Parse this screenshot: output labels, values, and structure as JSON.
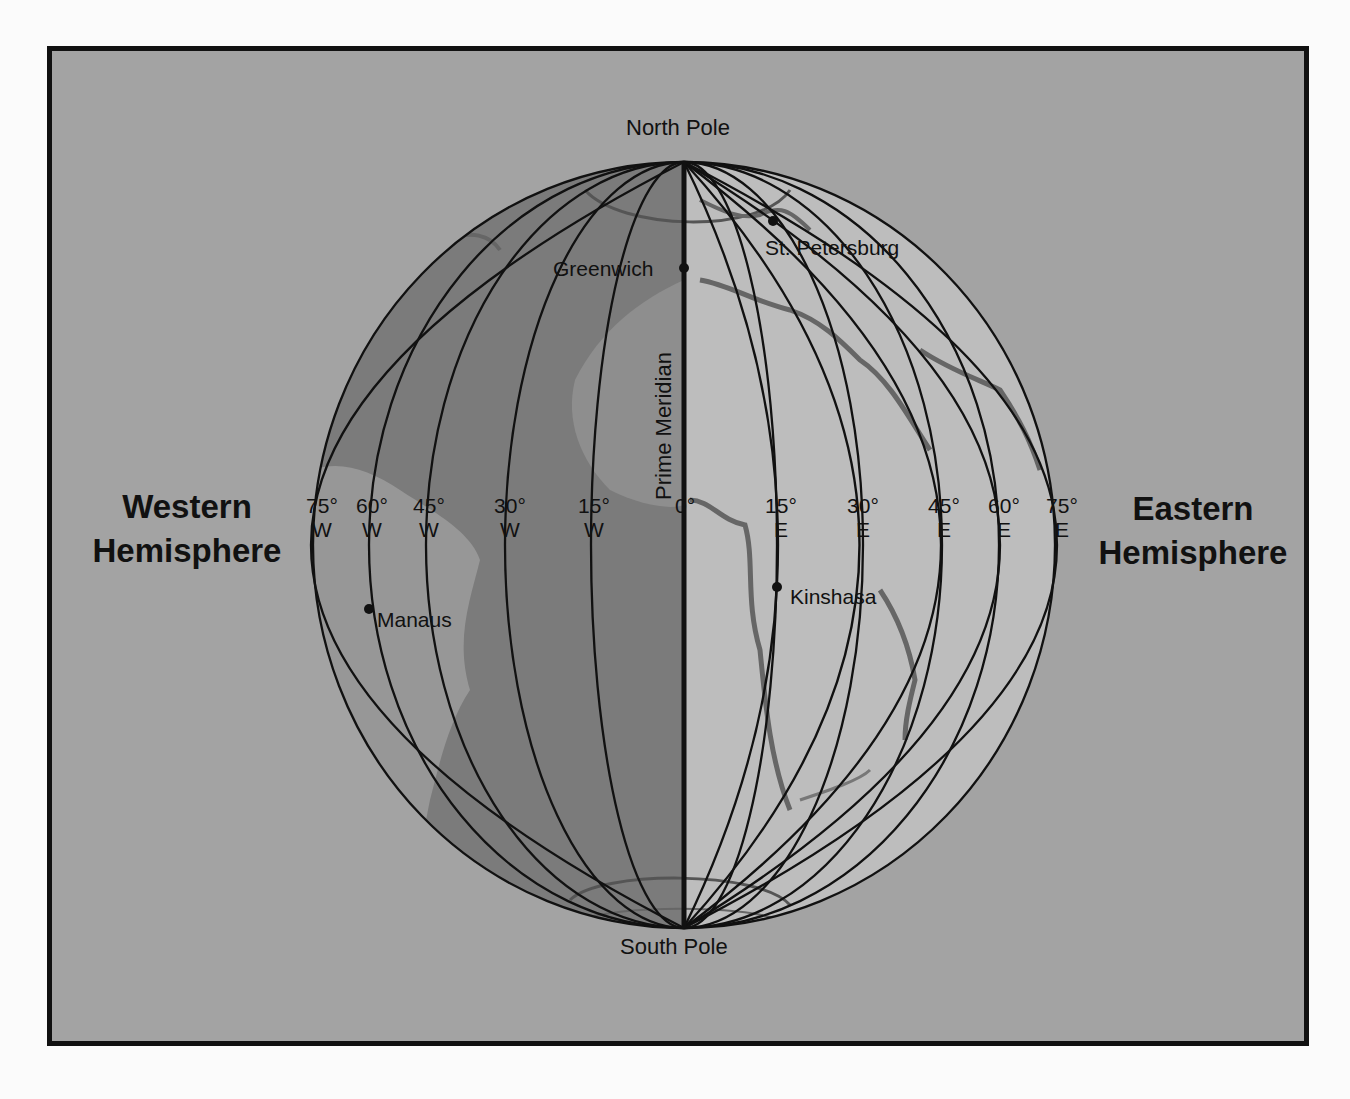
{
  "map": {
    "labels": {
      "north_pole": "North Pole",
      "south_pole": "South Pole",
      "prime_meridian": "Prime Meridian",
      "western_hemisphere": [
        "Western",
        "Hemisphere"
      ],
      "eastern_hemisphere": [
        "Eastern",
        "Hemisphere"
      ]
    },
    "longitude_ticks_west": [
      {
        "deg": "75°",
        "dir": "W",
        "x": 317
      },
      {
        "deg": "60°",
        "dir": "W",
        "x": 369
      },
      {
        "deg": "45°",
        "dir": "W",
        "x": 427
      },
      {
        "deg": "30°",
        "dir": "W",
        "x": 507
      },
      {
        "deg": "15°",
        "dir": "W",
        "x": 592
      }
    ],
    "longitude_zero": {
      "deg": "0°",
      "x": 683
    },
    "longitude_ticks_east": [
      {
        "deg": "15°",
        "dir": "E",
        "x": 779
      },
      {
        "deg": "30°",
        "dir": "E",
        "x": 860
      },
      {
        "deg": "45°",
        "dir": "E",
        "x": 941
      },
      {
        "deg": "60°",
        "dir": "E",
        "x": 1001
      },
      {
        "deg": "75°",
        "dir": "E",
        "x": 1059
      }
    ],
    "cities": [
      {
        "name": "Greenwich",
        "dot": [
          684,
          268
        ],
        "label_pos": [
          553,
          256
        ],
        "label_side": "left"
      },
      {
        "name": "St. Petersburg",
        "dot": [
          773,
          221
        ],
        "label_pos": [
          765,
          236
        ],
        "label_side": "below"
      },
      {
        "name": "Kinshasa",
        "dot": [
          777,
          587
        ],
        "label_pos": [
          790,
          585
        ],
        "label_side": "right"
      },
      {
        "name": "Manaus",
        "dot": [
          369,
          609
        ],
        "label_pos": [
          377,
          608
        ],
        "label_side": "right"
      }
    ],
    "colors": {
      "background": "#a3a3a3",
      "western_half": "#7b7b7b",
      "eastern_half": "#bdbdbd",
      "land_west": "#979797",
      "line": "#111111"
    }
  }
}
